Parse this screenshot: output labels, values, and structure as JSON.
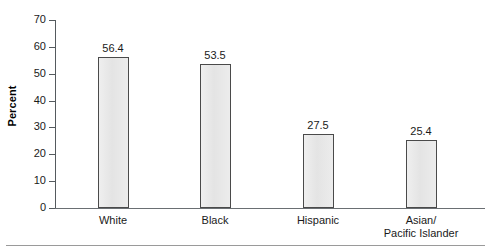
{
  "chart_data": {
    "type": "bar",
    "title": "",
    "subtitle": "",
    "xlabel": "",
    "ylabel": "Percent",
    "categories": [
      "White",
      "Black",
      "Hispanic",
      "Asian/\nPacific Islander"
    ],
    "values": [
      56.4,
      53.5,
      27.5,
      25.4
    ],
    "value_labels": [
      "56.4",
      "53.5",
      "27.5",
      "25.4"
    ],
    "ylim": [
      0,
      70
    ],
    "ytick_values": [
      0,
      10,
      20,
      30,
      40,
      50,
      60,
      70
    ],
    "ytick_labels": [
      "0",
      "10",
      "20",
      "30",
      "40",
      "50",
      "60",
      "70"
    ],
    "grid": false,
    "legend": false,
    "legend_position": "none",
    "series": [
      {
        "name": "Percent",
        "values": [
          56.4,
          53.5,
          27.5,
          25.4
        ]
      }
    ],
    "colors": {
      "bar_fill": "#e9e9e9",
      "bar_border": "#4a4a4a",
      "axis": "#555a5e",
      "text": "#1a1a1a",
      "background": "#ffffff",
      "footer_rule": "#9a9a9a"
    }
  },
  "axis": {
    "y_title": "Percent"
  }
}
